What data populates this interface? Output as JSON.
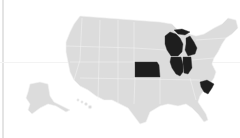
{
  "map": {
    "title": "United States",
    "base_color": "#dcdcdc",
    "highlight_color": "#1e1e1e",
    "background": "#ffffff",
    "highlighted_states": [
      "Wisconsin",
      "Michigan",
      "Illinois",
      "Indiana",
      "Kansas",
      "South Carolina"
    ],
    "other_regions": [
      "Contiguous United States",
      "Alaska",
      "Hawaii"
    ]
  }
}
